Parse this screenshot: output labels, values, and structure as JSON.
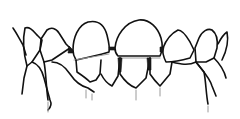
{
  "figure": {
    "style": "black line drawing on white",
    "colors": {
      "background": "#ffffff",
      "ink": "#111111",
      "shading": "#9a9a9a"
    }
  }
}
